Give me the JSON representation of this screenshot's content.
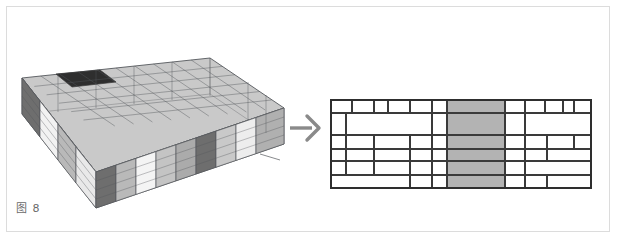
{
  "figure": {
    "caption": "图 8",
    "background_color": "#ffffff",
    "frame_color": "#dcdcdc"
  },
  "transform_arrow": {
    "icon": "right-arrow-icon",
    "direction": "right",
    "color": "#8a8a8a"
  },
  "model": {
    "title": "3d-building-massing-model",
    "description": "Axonometric wireframe building volume with shaded facade panels",
    "colors": {
      "wireframe": "#55585c",
      "panel_light": "#f2f2f2",
      "panel_mid": "#b9b9b9",
      "panel_gray": "#9a9a9a",
      "panel_dark": "#6e6e6e",
      "roof": "#c9c9c9",
      "void_dark": "#2f2f2f"
    },
    "facade_panels": [
      {
        "tone": "dark",
        "label": "end-bay-dark"
      },
      {
        "tone": "light",
        "label": "bay-light-1"
      },
      {
        "tone": "mid",
        "label": "bay-mid-1"
      },
      {
        "tone": "light",
        "label": "bay-light-2"
      },
      {
        "tone": "dark",
        "label": "core-dark"
      },
      {
        "tone": "mid",
        "label": "bay-mid-2"
      },
      {
        "tone": "light",
        "label": "bay-light-3"
      },
      {
        "tone": "mid",
        "label": "bay-mid-3"
      },
      {
        "tone": "dark",
        "label": "pier-dark"
      },
      {
        "tone": "mid",
        "label": "bay-mid-4"
      },
      {
        "tone": "light",
        "label": "bay-light-4"
      }
    ]
  },
  "facade_grid": {
    "title": "flattened-facade-grid",
    "description": "Unrolled elevation subdivided into irregular rectangular panels with a shaded central band",
    "colors": {
      "line": "#3a3a3a",
      "fill_empty": "#ffffff",
      "fill_shaded": "#b3b3b3",
      "outer_border": "#2e2e2e"
    },
    "size": {
      "width": 262,
      "height": 90
    },
    "row_edges": [
      0,
      14,
      36,
      50,
      62,
      76,
      90
    ],
    "shaded_band": {
      "x": 117,
      "width": 58,
      "label": "highlighted-central-band"
    },
    "cells": [
      {
        "x": 0,
        "y": 0,
        "w": 22,
        "h": 14,
        "shaded": false
      },
      {
        "x": 22,
        "y": 0,
        "w": 22,
        "h": 14,
        "shaded": false
      },
      {
        "x": 44,
        "y": 0,
        "w": 14,
        "h": 14,
        "shaded": false
      },
      {
        "x": 58,
        "y": 0,
        "w": 22,
        "h": 14,
        "shaded": false
      },
      {
        "x": 80,
        "y": 0,
        "w": 22,
        "h": 14,
        "shaded": false
      },
      {
        "x": 102,
        "y": 0,
        "w": 15,
        "h": 14,
        "shaded": false
      },
      {
        "x": 117,
        "y": 0,
        "w": 58,
        "h": 14,
        "shaded": true
      },
      {
        "x": 175,
        "y": 0,
        "w": 20,
        "h": 14,
        "shaded": false
      },
      {
        "x": 195,
        "y": 0,
        "w": 20,
        "h": 14,
        "shaded": false
      },
      {
        "x": 215,
        "y": 0,
        "w": 18,
        "h": 14,
        "shaded": false
      },
      {
        "x": 233,
        "y": 0,
        "w": 11,
        "h": 14,
        "shaded": false
      },
      {
        "x": 244,
        "y": 0,
        "w": 18,
        "h": 14,
        "shaded": false
      },
      {
        "x": 0,
        "y": 14,
        "w": 16,
        "h": 22,
        "shaded": false
      },
      {
        "x": 16,
        "y": 14,
        "w": 86,
        "h": 22,
        "shaded": false
      },
      {
        "x": 102,
        "y": 14,
        "w": 15,
        "h": 22,
        "shaded": false
      },
      {
        "x": 117,
        "y": 14,
        "w": 58,
        "h": 22,
        "shaded": true
      },
      {
        "x": 175,
        "y": 14,
        "w": 20,
        "h": 22,
        "shaded": false
      },
      {
        "x": 195,
        "y": 14,
        "w": 67,
        "h": 22,
        "shaded": false
      },
      {
        "x": 0,
        "y": 36,
        "w": 16,
        "h": 14,
        "shaded": false
      },
      {
        "x": 16,
        "y": 36,
        "w": 28,
        "h": 14,
        "shaded": false
      },
      {
        "x": 44,
        "y": 36,
        "w": 36,
        "h": 14,
        "shaded": false
      },
      {
        "x": 80,
        "y": 36,
        "w": 22,
        "h": 14,
        "shaded": false
      },
      {
        "x": 102,
        "y": 36,
        "w": 15,
        "h": 14,
        "shaded": false
      },
      {
        "x": 117,
        "y": 36,
        "w": 58,
        "h": 14,
        "shaded": true
      },
      {
        "x": 175,
        "y": 36,
        "w": 20,
        "h": 14,
        "shaded": false
      },
      {
        "x": 195,
        "y": 36,
        "w": 22,
        "h": 14,
        "shaded": false
      },
      {
        "x": 217,
        "y": 36,
        "w": 27,
        "h": 14,
        "shaded": false
      },
      {
        "x": 244,
        "y": 36,
        "w": 18,
        "h": 14,
        "shaded": false
      },
      {
        "x": 0,
        "y": 50,
        "w": 16,
        "h": 12,
        "shaded": false
      },
      {
        "x": 16,
        "y": 50,
        "w": 28,
        "h": 12,
        "shaded": false
      },
      {
        "x": 44,
        "y": 50,
        "w": 36,
        "h": 12,
        "shaded": false
      },
      {
        "x": 80,
        "y": 50,
        "w": 22,
        "h": 12,
        "shaded": false
      },
      {
        "x": 102,
        "y": 50,
        "w": 15,
        "h": 12,
        "shaded": false
      },
      {
        "x": 117,
        "y": 50,
        "w": 58,
        "h": 12,
        "shaded": true
      },
      {
        "x": 175,
        "y": 50,
        "w": 20,
        "h": 12,
        "shaded": false
      },
      {
        "x": 195,
        "y": 50,
        "w": 22,
        "h": 12,
        "shaded": false
      },
      {
        "x": 217,
        "y": 50,
        "w": 45,
        "h": 12,
        "shaded": false
      },
      {
        "x": 0,
        "y": 62,
        "w": 16,
        "h": 14,
        "shaded": false
      },
      {
        "x": 16,
        "y": 62,
        "w": 28,
        "h": 14,
        "shaded": false
      },
      {
        "x": 44,
        "y": 62,
        "w": 36,
        "h": 14,
        "shaded": false
      },
      {
        "x": 80,
        "y": 62,
        "w": 22,
        "h": 14,
        "shaded": false
      },
      {
        "x": 102,
        "y": 62,
        "w": 15,
        "h": 14,
        "shaded": false
      },
      {
        "x": 117,
        "y": 62,
        "w": 58,
        "h": 14,
        "shaded": true
      },
      {
        "x": 175,
        "y": 62,
        "w": 20,
        "h": 14,
        "shaded": false
      },
      {
        "x": 195,
        "y": 62,
        "w": 67,
        "h": 14,
        "shaded": false
      },
      {
        "x": 0,
        "y": 76,
        "w": 80,
        "h": 14,
        "shaded": false
      },
      {
        "x": 80,
        "y": 76,
        "w": 22,
        "h": 14,
        "shaded": false
      },
      {
        "x": 102,
        "y": 76,
        "w": 15,
        "h": 14,
        "shaded": false
      },
      {
        "x": 117,
        "y": 76,
        "w": 58,
        "h": 14,
        "shaded": true
      },
      {
        "x": 175,
        "y": 76,
        "w": 20,
        "h": 14,
        "shaded": false
      },
      {
        "x": 195,
        "y": 76,
        "w": 22,
        "h": 14,
        "shaded": false
      },
      {
        "x": 217,
        "y": 76,
        "w": 45,
        "h": 14,
        "shaded": false
      }
    ]
  }
}
